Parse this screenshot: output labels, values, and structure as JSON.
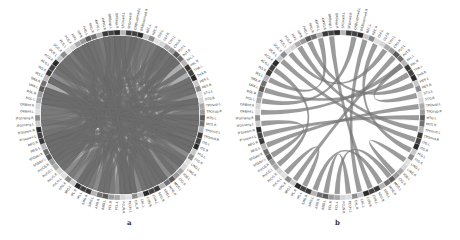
{
  "figure": {
    "panels": [
      {
        "id": "a",
        "label": "a",
        "center": [
          120,
          115
        ],
        "radius": 80,
        "ring_width": 5,
        "label_pos": [
          127,
          224
        ],
        "chord_color": "#6e6e6e",
        "chord_opacity": 0.55,
        "density": "dense"
      },
      {
        "id": "b",
        "label": "b",
        "center": [
          340,
          115
        ],
        "radius": 80,
        "ring_width": 5,
        "label_pos": [
          335,
          224
        ],
        "chord_color": "#7a7a7a",
        "chord_opacity": 0.75,
        "density": "sparse"
      }
    ],
    "node_labels": [
      "SFGmed.L",
      "SFGmed.R",
      "ORBsupmed.L",
      "ORBsupmed.R",
      "REC.L",
      "REC.R",
      "OLF.L",
      "OLF.R",
      "CAU.L",
      "CAU.R",
      "PUT.L",
      "PUT.R",
      "PAL.L",
      "PAL.R",
      "THA.L",
      "THA.R",
      "HES.L",
      "HES.R",
      "STG.L",
      "STG.R",
      "TPOsup.L",
      "TPOsup.R",
      "MTG.L",
      "MTG.R",
      "TPOmid.L",
      "TPOmid.R",
      "ITG.L",
      "ITG.R",
      "FFG.L",
      "FFG.R",
      "LING.L",
      "LING.R",
      "IOG.L",
      "IOG.R",
      "MOG.L",
      "MOG.R",
      "SOG.L",
      "SOG.R",
      "CUN.L",
      "CUN.R",
      "CAL.L",
      "CAL.R",
      "PCUN.L",
      "PCUN.R",
      "PCL.L",
      "PCL.R",
      "ANG.L",
      "ANG.R",
      "SMG.L",
      "SMG.R",
      "IPL.L",
      "IPL.R",
      "SPG.L",
      "SPG.R",
      "PoCG.L",
      "PoCG.R",
      "PreCG.L",
      "PreCG.R",
      "SFGdor.L",
      "SFGdor.R",
      "MFG.L",
      "MFG.R",
      "IFGoperc.L",
      "IFGoperc.R",
      "IFGtriang.L",
      "IFGtriang.R",
      "ORBinf.L",
      "ORBinf.R",
      "ROL.L",
      "ROL.R",
      "SMA.L",
      "SMA.R",
      "INS.L",
      "INS.R",
      "ACG.L",
      "ACG.R",
      "DCG.L",
      "DCG.R",
      "PCG.L",
      "PCG.R",
      "HIP.L",
      "HIP.R",
      "PHG.L",
      "PHG.R",
      "AMYG.L",
      "AMYG.R",
      "ORBsup.L",
      "ORBsup.R"
    ],
    "ring_shades": [
      "#2a2a2a",
      "#5a5a5a",
      "#8c8c8c",
      "#b5b5b5",
      "#d6d6d6",
      "#444444",
      "#9a9a9a",
      "#c8c8c8",
      "#707070",
      "#e0e0e0",
      "#3a3a3a",
      "#a8a8a8"
    ],
    "chords_b": [
      [
        4,
        40
      ],
      [
        6,
        28
      ],
      [
        10,
        52
      ],
      [
        12,
        18
      ],
      [
        14,
        70
      ],
      [
        20,
        60
      ],
      [
        22,
        62
      ],
      [
        24,
        80
      ],
      [
        30,
        33
      ],
      [
        34,
        44
      ],
      [
        36,
        48
      ],
      [
        42,
        46
      ],
      [
        50,
        54
      ],
      [
        56,
        74
      ],
      [
        58,
        64
      ],
      [
        66,
        12
      ],
      [
        68,
        2
      ],
      [
        72,
        84
      ],
      [
        76,
        26
      ],
      [
        78,
        8
      ],
      [
        82,
        16
      ],
      [
        86,
        38
      ]
    ],
    "chords_a_count": 220
  }
}
